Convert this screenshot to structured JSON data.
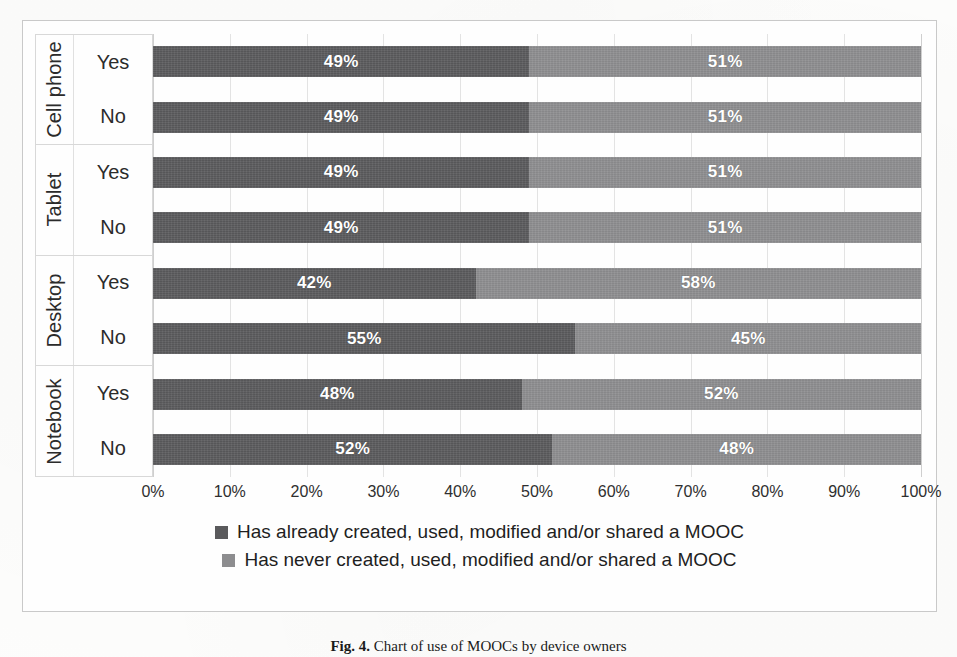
{
  "chart_data": {
    "type": "bar",
    "subtype": "stacked-horizontal-100pct",
    "title": "",
    "xlabel": "",
    "ylabel": "",
    "xlim": [
      0,
      100
    ],
    "xtick_labels": [
      "0%",
      "10%",
      "20%",
      "30%",
      "40%",
      "50%",
      "60%",
      "70%",
      "80%",
      "90%",
      "100%"
    ],
    "xtick_values": [
      0,
      10,
      20,
      30,
      40,
      50,
      60,
      70,
      80,
      90,
      100
    ],
    "grid": true,
    "legend_position": "bottom",
    "series": [
      {
        "name": "Has already created, used, modified and/or shared a MOOC",
        "color": "#5a5a5c",
        "values": [
          49,
          49,
          49,
          49,
          42,
          55,
          48,
          52
        ]
      },
      {
        "name": "Has never created, used, modified and/or shared a MOOC",
        "color": "#8d8d8f",
        "values": [
          51,
          51,
          51,
          51,
          58,
          45,
          52,
          48
        ]
      }
    ],
    "categories": [
      "Cell phone - Yes",
      "Cell phone - No",
      "Tablet - Yes",
      "Tablet - No",
      "Desktop - Yes",
      "Desktop - No",
      "Notebook - Yes",
      "Notebook - No"
    ],
    "groups": [
      {
        "device": "Cell phone",
        "rows": [
          {
            "answer": "Yes",
            "values": [
              49,
              51
            ],
            "labels": [
              "49%",
              "51%"
            ]
          },
          {
            "answer": "No",
            "values": [
              49,
              51
            ],
            "labels": [
              "49%",
              "51%"
            ]
          }
        ]
      },
      {
        "device": "Tablet",
        "rows": [
          {
            "answer": "Yes",
            "values": [
              49,
              51
            ],
            "labels": [
              "49%",
              "51%"
            ]
          },
          {
            "answer": "No",
            "values": [
              49,
              51
            ],
            "labels": [
              "49%",
              "51%"
            ]
          }
        ]
      },
      {
        "device": "Desktop",
        "rows": [
          {
            "answer": "Yes",
            "values": [
              42,
              58
            ],
            "labels": [
              "42%",
              "58%"
            ]
          },
          {
            "answer": "No",
            "values": [
              55,
              45
            ],
            "labels": [
              "55%",
              "45%"
            ]
          }
        ]
      },
      {
        "device": "Notebook",
        "rows": [
          {
            "answer": "Yes",
            "values": [
              48,
              52
            ],
            "labels": [
              "48%",
              "52%"
            ]
          },
          {
            "answer": "No",
            "values": [
              52,
              48
            ],
            "labels": [
              "52%",
              "48%"
            ]
          }
        ]
      }
    ]
  },
  "legend": {
    "items": [
      {
        "label": "Has already created, used, modified and/or shared a MOOC",
        "color": "#5a5a5c"
      },
      {
        "label": "Has never created, used, modified and/or shared a MOOC",
        "color": "#8d8d8f"
      }
    ]
  },
  "caption": {
    "figure_number": "Fig. 4.",
    "text": "Chart of use of MOOCs by device owners"
  }
}
